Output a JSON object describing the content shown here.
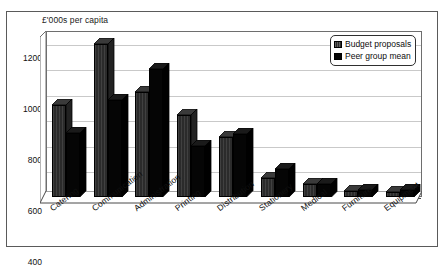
{
  "chart_data": {
    "type": "bar",
    "title": "",
    "ylabel": "£'000s per capita",
    "xlabel": "",
    "categories": [
      "Catering",
      "Communication",
      "Administration",
      "Printing",
      "Distribution",
      "Stationery",
      "Medical",
      "Furniture",
      "Equipment"
    ],
    "series": [
      {
        "name": "Budget proposals",
        "values": [
          720,
          1200,
          820,
          640,
          470,
          150,
          100,
          45,
          40
        ],
        "color": "#2b2b2b"
      },
      {
        "name": "Peer group mean",
        "values": [
          500,
          760,
          1000,
          400,
          490,
          220,
          105,
          55,
          55
        ],
        "color": "#050505"
      }
    ],
    "ylim": [
      0,
      1300
    ],
    "yticks": [
      0,
      200,
      400,
      600,
      800,
      1000,
      1200
    ],
    "ytick_labels": [
      "0",
      "200",
      "400",
      "600",
      "800",
      "1000",
      "1200"
    ],
    "grid": true,
    "legend_position": "top-right",
    "style": "3d-column"
  },
  "legend": {
    "entries": [
      {
        "label": "Budget proposals"
      },
      {
        "label": "Peer group mean"
      }
    ]
  }
}
